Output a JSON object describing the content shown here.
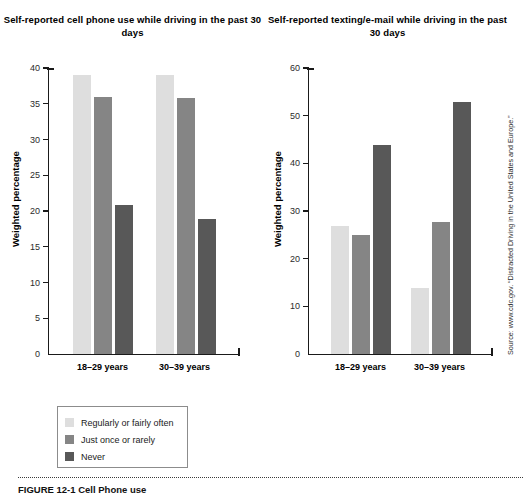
{
  "figure": {
    "caption": "FIGURE 12-1  Cell Phone use",
    "source_note": "Source: www.cdc.gov. “Distracted Driving in the United States and Europe.”"
  },
  "legend": {
    "items": [
      {
        "label": "Regularly or fairly often",
        "color": "#dedede"
      },
      {
        "label": "Just once or rarely",
        "color": "#858585"
      },
      {
        "label": "Never",
        "color": "#585858"
      }
    ]
  },
  "chart_data": [
    {
      "type": "bar",
      "title": "Self-reported cell phone use while driving in the past 30 days",
      "xlabel": "",
      "ylabel": "Weighted percentage",
      "categories": [
        "18–29 years",
        "30–39 years"
      ],
      "ylim": [
        0,
        40
      ],
      "yticks": [
        0,
        5,
        10,
        15,
        20,
        25,
        30,
        35,
        40
      ],
      "grid": false,
      "legend_position": "below-left",
      "series": [
        {
          "name": "Regularly or fairly often",
          "color": "#dedede",
          "values": [
            39.0,
            39.0
          ]
        },
        {
          "name": "Just once or rarely",
          "color": "#858585",
          "values": [
            36.0,
            35.8
          ]
        },
        {
          "name": "Never",
          "color": "#585858",
          "values": [
            20.9,
            18.9
          ]
        }
      ]
    },
    {
      "type": "bar",
      "title": "Self-reported texting/e-mail while driving in the past 30 days",
      "xlabel": "",
      "ylabel": "Weighted percentage",
      "categories": [
        "18–29 years",
        "30–39 years"
      ],
      "ylim": [
        0,
        60
      ],
      "yticks": [
        0,
        10,
        20,
        30,
        40,
        50,
        60
      ],
      "grid": false,
      "legend_position": "below-left",
      "series": [
        {
          "name": "Regularly or fairly often",
          "color": "#dedede",
          "values": [
            26.8,
            13.9
          ]
        },
        {
          "name": "Just once or rarely",
          "color": "#858585",
          "values": [
            24.9,
            27.8
          ]
        },
        {
          "name": "Never",
          "color": "#585858",
          "values": [
            43.9,
            52.8
          ]
        }
      ]
    }
  ]
}
